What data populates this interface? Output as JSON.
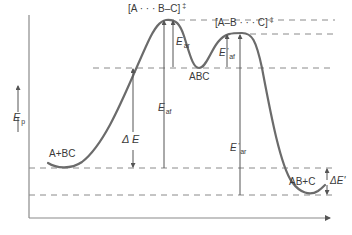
{
  "diagram": {
    "type": "potential-energy-reaction-profile",
    "y_axis_label": "E",
    "y_axis_label_sub": "p",
    "colors": {
      "curve": "#6b6b6b",
      "axes": "#8a8a8a",
      "dashed": "#8a8a8a",
      "text": "#3a3a3a"
    },
    "species": {
      "reactants": "A+BC",
      "intermediate": "ABC",
      "products": "AB+C",
      "ts1": "[A · · · B–C]",
      "ts2": "[A–B · · · C]",
      "double_dagger": "‡"
    },
    "energies": {
      "e_ar": {
        "main": "E",
        "sub": "ar"
      },
      "e_af": {
        "main": "E",
        "sub": "af"
      },
      "e_af_prime": {
        "main": "E",
        "prime": "'",
        "sub": "af"
      },
      "e_ar_prime": {
        "main": "E",
        "prime": "'",
        "sub": "ar"
      },
      "delta_e": "Δ E",
      "delta_e_prime": "ΔE'"
    }
  }
}
